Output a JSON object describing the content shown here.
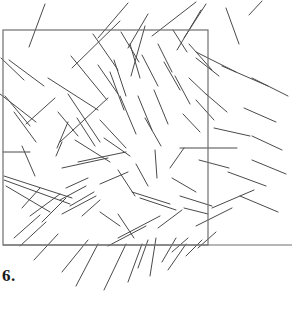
{
  "figure": {
    "caption": "6.",
    "background_color": "#ffffff",
    "segment_color": "#4a4a4a",
    "outline_color": "#6e6e6e",
    "segment_width": 1,
    "outline_width": 1.2,
    "canvas": {
      "width": 292,
      "height": 309
    },
    "region_rectangle": {
      "name": "outlined-square-region",
      "x": 3,
      "y": 30,
      "width": 205,
      "height": 215
    },
    "baseline": {
      "name": "horizontal-baseline",
      "x1": 3,
      "y1": 245,
      "x2": 292,
      "y2": 245
    },
    "segment_count": 88,
    "segments": [
      [
        45,
        4,
        29,
        47
      ],
      [
        98,
        38,
        128,
        3
      ],
      [
        72,
        68,
        120,
        21
      ],
      [
        128,
        48,
        148,
        14
      ],
      [
        131,
        76,
        145,
        26
      ],
      [
        152,
        36,
        196,
        2
      ],
      [
        206,
        4,
        184,
        38
      ],
      [
        177,
        50,
        201,
        10
      ],
      [
        226,
        8,
        239,
        44
      ],
      [
        249,
        15,
        262,
        1
      ],
      [
        9,
        60,
        44,
        86
      ],
      [
        1,
        58,
        24,
        80
      ],
      [
        0,
        94,
        36,
        122
      ],
      [
        5,
        96,
        30,
        126
      ],
      [
        14,
        112,
        36,
        142
      ],
      [
        22,
        146,
        35,
        176
      ],
      [
        26,
        124,
        55,
        98
      ],
      [
        48,
        78,
        98,
        110
      ],
      [
        60,
        142,
        108,
        98
      ],
      [
        71,
        56,
        107,
        100
      ],
      [
        93,
        34,
        118,
        70
      ],
      [
        68,
        94,
        100,
        142
      ],
      [
        98,
        65,
        118,
        94
      ],
      [
        114,
        60,
        126,
        96
      ],
      [
        58,
        112,
        78,
        136
      ],
      [
        77,
        118,
        95,
        146
      ],
      [
        57,
        148,
        68,
        122
      ],
      [
        110,
        72,
        124,
        110
      ],
      [
        120,
        96,
        136,
        134
      ],
      [
        130,
        44,
        140,
        78
      ],
      [
        121,
        32,
        139,
        62
      ],
      [
        142,
        55,
        158,
        86
      ],
      [
        158,
        44,
        172,
        72
      ],
      [
        164,
        62,
        180,
        90
      ],
      [
        173,
        30,
        187,
        52
      ],
      [
        189,
        44,
        212,
        70
      ],
      [
        196,
        58,
        219,
        76
      ],
      [
        189,
        78,
        208,
        96
      ],
      [
        206,
        94,
        227,
        112
      ],
      [
        196,
        100,
        214,
        120
      ],
      [
        183,
        114,
        200,
        132
      ],
      [
        175,
        76,
        190,
        104
      ],
      [
        138,
        96,
        152,
        130
      ],
      [
        145,
        118,
        161,
        146
      ],
      [
        154,
        90,
        168,
        124
      ],
      [
        100,
        120,
        126,
        148
      ],
      [
        104,
        138,
        130,
        156
      ],
      [
        75,
        140,
        110,
        162
      ],
      [
        56,
        156,
        62,
        142
      ],
      [
        3,
        152,
        30,
        152
      ],
      [
        180,
        148,
        237,
        148
      ],
      [
        199,
        160,
        229,
        168
      ],
      [
        155,
        150,
        157,
        178
      ],
      [
        78,
        162,
        126,
        152
      ],
      [
        62,
        168,
        108,
        158
      ],
      [
        4,
        176,
        72,
        198
      ],
      [
        4,
        180,
        70,
        204
      ],
      [
        6,
        186,
        50,
        212
      ],
      [
        66,
        188,
        88,
        178
      ],
      [
        100,
        184,
        128,
        172
      ],
      [
        136,
        164,
        148,
        186
      ],
      [
        118,
        170,
        135,
        196
      ],
      [
        132,
        192,
        170,
        204
      ],
      [
        140,
        198,
        176,
        210
      ],
      [
        170,
        168,
        184,
        148
      ],
      [
        172,
        178,
        196,
        192
      ],
      [
        180,
        196,
        212,
        206
      ],
      [
        184,
        208,
        208,
        214
      ],
      [
        22,
        208,
        40,
        188
      ],
      [
        30,
        216,
        60,
        194
      ],
      [
        42,
        222,
        66,
        198
      ],
      [
        60,
        200,
        86,
        186
      ],
      [
        70,
        206,
        94,
        192
      ],
      [
        62,
        214,
        96,
        196
      ],
      [
        82,
        216,
        100,
        200
      ],
      [
        100,
        212,
        120,
        226
      ],
      [
        118,
        214,
        134,
        238
      ],
      [
        14,
        238,
        40,
        215
      ],
      [
        20,
        246,
        46,
        222
      ],
      [
        34,
        260,
        58,
        234
      ],
      [
        62,
        272,
        88,
        240
      ],
      [
        76,
        286,
        98,
        244
      ],
      [
        104,
        290,
        126,
        244
      ],
      [
        128,
        282,
        142,
        244
      ],
      [
        138,
        268,
        148,
        240
      ],
      [
        150,
        276,
        156,
        238
      ],
      [
        162,
        262,
        176,
        238
      ],
      [
        168,
        270,
        186,
        244
      ],
      [
        186,
        256,
        202,
        240
      ],
      [
        198,
        248,
        216,
        232
      ],
      [
        172,
        252,
        188,
        238
      ],
      [
        108,
        246,
        146,
        226
      ],
      [
        158,
        228,
        182,
        210
      ],
      [
        118,
        238,
        160,
        216
      ],
      [
        196,
        226,
        232,
        208
      ],
      [
        212,
        208,
        254,
        190
      ],
      [
        240,
        196,
        278,
        212
      ],
      [
        228,
        172,
        266,
        186
      ],
      [
        252,
        160,
        286,
        174
      ],
      [
        214,
        128,
        250,
        136
      ],
      [
        196,
        52,
        236,
        72
      ],
      [
        222,
        66,
        268,
        86
      ],
      [
        252,
        78,
        288,
        96
      ],
      [
        244,
        108,
        276,
        122
      ],
      [
        252,
        136,
        282,
        150
      ]
    ]
  }
}
